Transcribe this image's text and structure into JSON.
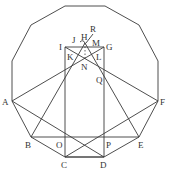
{
  "diagram": {
    "type": "geometry",
    "shape": "regular dodecagon with inscribed star construction",
    "labels": {
      "A": "A",
      "B": "B",
      "C": "C",
      "D": "D",
      "E": "E",
      "F": "F",
      "G": "G",
      "H": "H",
      "I": "I",
      "J": "J",
      "K": "K",
      "L": "L",
      "M": "M",
      "N": "N",
      "O": "O",
      "P": "P",
      "Q": "Q",
      "R": "R"
    },
    "colors": {
      "line": "#3a3a3a",
      "label": "#333333",
      "background": "#ffffff"
    }
  }
}
